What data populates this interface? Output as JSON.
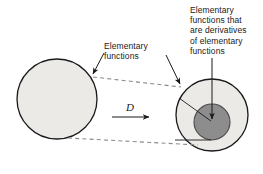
{
  "figure": {
    "background_color": "#ffffff",
    "width": 263,
    "height": 174
  },
  "labels": {
    "left_set": "Elementary\nfunctions",
    "right_subset": "Elementary\nfunctions that\nare derivatives\nof elementary\nfunctions",
    "operator": "D"
  },
  "colors": {
    "outline": "#1a1a1a",
    "light_fill": "#eceae7",
    "dark_fill": "#8d8d8d",
    "dashed_line": "#8a8a8a",
    "text": "#1a1a1a"
  },
  "shapes": {
    "left_circle": {
      "name": "elementary-functions-set",
      "cx": 57,
      "cy": 99,
      "r": 40,
      "fill": "#eceae7"
    },
    "right_outer_circle": {
      "name": "image-set-outer",
      "cx": 212,
      "cy": 115,
      "r": 36,
      "fill": "#eceae7"
    },
    "right_inner_circle": {
      "name": "derivatives-subset",
      "cx": 212,
      "cy": 122,
      "r": 18,
      "fill": "#8d8d8d"
    }
  },
  "connectors": {
    "upper_tangent": {
      "name": "upper-tangent-dashed",
      "x1": 92,
      "y1": 76,
      "x2": 180,
      "y2": 86
    },
    "lower_tangent": {
      "name": "lower-tangent-dashed",
      "x1": 70,
      "y1": 138,
      "x2": 196,
      "y2": 145
    },
    "operator_arrow": {
      "name": "operator-d-arrow",
      "x1": 112,
      "y1": 117,
      "x2": 152,
      "y2": 117
    },
    "leader_to_left_circle": {
      "name": "leader-left-set",
      "x1": 104,
      "y1": 52,
      "x2": 92,
      "y2": 76
    },
    "leader_to_right_circle": {
      "name": "leader-right-set",
      "x1": 168,
      "y1": 56,
      "x2": 181,
      "y2": 86
    },
    "leader_to_inner_circle": {
      "name": "leader-derivatives-subset",
      "x1": 212,
      "y1": 58,
      "x2": 212,
      "y2": 121
    },
    "leader_inner_left": {
      "name": "leader-inner-horizontal",
      "x1": 176,
      "y1": 140,
      "x2": 212,
      "y2": 140
    },
    "leader_inner_diagonal": {
      "name": "leader-inner-diagonal",
      "x1": 180,
      "y1": 98,
      "x2": 212,
      "y2": 121
    }
  }
}
